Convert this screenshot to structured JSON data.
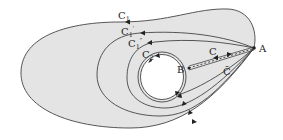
{
  "diagram": {
    "type": "contour-deformation",
    "colors": {
      "region_fill": "#e4e4e4",
      "stroke": "#444444",
      "hole_fill": "#ffffff"
    },
    "points": {
      "A": {
        "label": "A"
      },
      "B": {
        "label": "B"
      }
    },
    "contours": [
      {
        "id": "C1",
        "label": "C",
        "sub": "1",
        "prime": ""
      },
      {
        "id": "C1p",
        "label": "C",
        "sub": "1",
        "prime": "′"
      },
      {
        "id": "C1pp",
        "label": "C",
        "sub": "1",
        "prime": "″"
      },
      {
        "id": "C2",
        "label": "C",
        "sub": "2",
        "prime": ""
      }
    ],
    "cut_labels": {
      "upper": "C",
      "lower": "C̄"
    }
  }
}
